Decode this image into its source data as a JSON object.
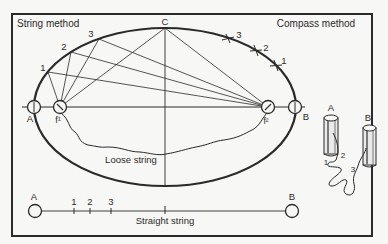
{
  "title_left": "String method",
  "title_right": "Compass method",
  "points": {
    "A": "A",
    "B": "B",
    "C": "C",
    "f1": "f¹",
    "f2": "f²"
  },
  "string_points": [
    "1",
    "2",
    "3"
  ],
  "compass_points": [
    "3",
    "2",
    "1"
  ],
  "loose_string_label": "Loose string",
  "straight_string": {
    "label": "Straight string",
    "end_a": "A",
    "end_b": "B",
    "ticks": [
      "1",
      "2",
      "3"
    ]
  },
  "cylinders": {
    "left": "A",
    "right": "B",
    "string_ticks": [
      "1",
      "2",
      "3"
    ]
  },
  "colors": {
    "ink": "#2a2a2a",
    "paper": "#f7f7f5"
  }
}
